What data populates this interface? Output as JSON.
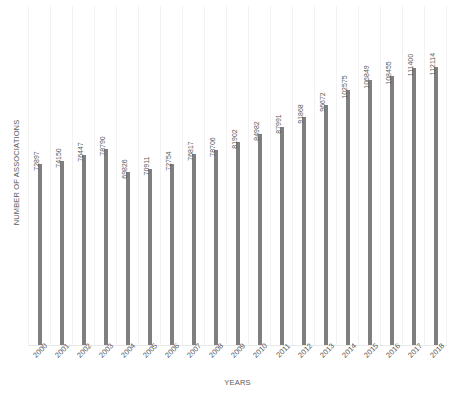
{
  "chart_data": {
    "type": "bar",
    "title": "",
    "xlabel": "YEARS",
    "ylabel": "NUMBER OF ASSOCIATIONS",
    "categories": [
      "2000",
      "2001",
      "2002",
      "2003",
      "2004",
      "2005",
      "2006",
      "2007",
      "2008",
      "2009",
      "2010",
      "2011",
      "2012",
      "2013",
      "2014",
      "2015",
      "2016",
      "2017",
      "2018"
    ],
    "values": [
      72897,
      74150,
      76447,
      78790,
      69826,
      70911,
      72754,
      76817,
      78706,
      81902,
      84982,
      87991,
      91868,
      96672,
      102575,
      106849,
      108455,
      111400,
      112114
    ],
    "labels": [
      "72897",
      "74150",
      "76447",
      "78790",
      "69826",
      "70911",
      "72754",
      "76817",
      "78706",
      "81902",
      "84982",
      "87991",
      "91868",
      "96672",
      "102575",
      "106849",
      "108455",
      "111400",
      "112114"
    ],
    "ylim": [
      0,
      118000
    ],
    "grid": true,
    "grid_orientation": "vertical",
    "legend": "none",
    "y_tick_labels": [],
    "bar_color": "#7f7f7f",
    "gridline_color": "#f2f2f2",
    "axis_color": "#e8e8e8",
    "text_color": "#595959",
    "background_color": "#ffffff",
    "data_label_rotation": 90,
    "x_tick_rotation": 45
  }
}
